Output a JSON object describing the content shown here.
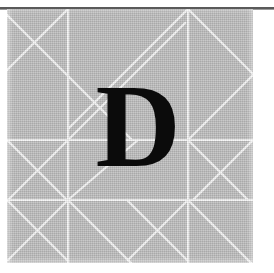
{
  "figure": {
    "glyph": "D",
    "glyph_description": "large black serif capital letter D",
    "canvas": {
      "width": 274,
      "height": 273,
      "background_color": "#ffffff"
    },
    "plate": {
      "x": 7,
      "y": 9,
      "width": 246,
      "height": 254,
      "fill_color": "#b5b5b5",
      "texture": "halftone-paper-grain"
    },
    "top_rule": {
      "color": "#5a5a5a",
      "y": 7,
      "thickness": 2
    },
    "grid": {
      "line_color": "#f2f2f2",
      "line_width": 2,
      "vertical_lines_x": [
        0,
        61,
        181,
        246
      ],
      "horizontal_lines_y": [
        0,
        131,
        191,
        254
      ],
      "cell_size": 60,
      "description": "white ruled grid with diagonal cross-hatching forming triangles and X shapes"
    },
    "diagonals": [
      {
        "x1": 0,
        "y1": 0,
        "x2": 131,
        "y2": 131
      },
      {
        "x1": 61,
        "y1": 0,
        "x2": 0,
        "y2": 61
      },
      {
        "x1": 181,
        "y1": 0,
        "x2": 61,
        "y2": 120
      },
      {
        "x1": 181,
        "y1": 0,
        "x2": 246,
        "y2": 65
      },
      {
        "x1": 181,
        "y1": 0,
        "x2": 181,
        "y2": 254
      },
      {
        "x1": 0,
        "y1": 131,
        "x2": 61,
        "y2": 191
      },
      {
        "x1": 61,
        "y1": 131,
        "x2": 0,
        "y2": 191
      },
      {
        "x1": 61,
        "y1": 131,
        "x2": 181,
        "y2": 11
      },
      {
        "x1": 61,
        "y1": 191,
        "x2": 0,
        "y2": 254
      },
      {
        "x1": 61,
        "y1": 191,
        "x2": 131,
        "y2": 254
      },
      {
        "x1": 181,
        "y1": 191,
        "x2": 121,
        "y2": 254
      },
      {
        "x1": 181,
        "y1": 191,
        "x2": 246,
        "y2": 254
      },
      {
        "x1": 181,
        "y1": 131,
        "x2": 246,
        "y2": 191
      },
      {
        "x1": 246,
        "y1": 131,
        "x2": 181,
        "y2": 191
      },
      {
        "x1": 131,
        "y1": 131,
        "x2": 61,
        "y2": 191
      }
    ]
  }
}
